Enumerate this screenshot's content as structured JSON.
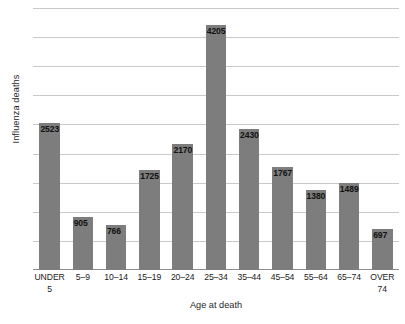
{
  "chart_data": {
    "type": "bar",
    "title": "",
    "xlabel": "Age at death",
    "ylabel": "Influenza deaths",
    "categories": [
      "UNDER 5",
      "5–9",
      "10–14",
      "15–19",
      "20–24",
      "25–34",
      "35–44",
      "45–54",
      "55–64",
      "65–74",
      "OVER 74"
    ],
    "category_lines": [
      [
        "UNDER",
        "5"
      ],
      [
        "5–9",
        ""
      ],
      [
        "10–14",
        ""
      ],
      [
        "15–19",
        ""
      ],
      [
        "20–24",
        ""
      ],
      [
        "25–34",
        ""
      ],
      [
        "35–44",
        ""
      ],
      [
        "45–54",
        ""
      ],
      [
        "55–64",
        ""
      ],
      [
        "65–74",
        ""
      ],
      [
        "OVER",
        "74"
      ]
    ],
    "values": [
      2523,
      905,
      766,
      1725,
      2170,
      4205,
      2430,
      1767,
      1380,
      1489,
      697
    ],
    "value_labels": [
      "2523",
      "905",
      "766",
      "1725",
      "2170",
      "4205",
      "2430",
      "1767",
      "1380",
      "1489",
      "697"
    ],
    "ylim": [
      0,
      4500
    ],
    "y_gridline_values": [
      500,
      1000,
      1500,
      2000,
      2500,
      3000,
      3500,
      4000,
      4500
    ],
    "grid": true,
    "y_tick_labels_visible": false,
    "legend": "none",
    "bar_color": "#7d7d7d",
    "gridline_color": "#c9c9c9",
    "axis_color": "#8e8e8e"
  },
  "axes": {
    "y_title": "Influenza deaths",
    "x_title": "Age at death"
  }
}
